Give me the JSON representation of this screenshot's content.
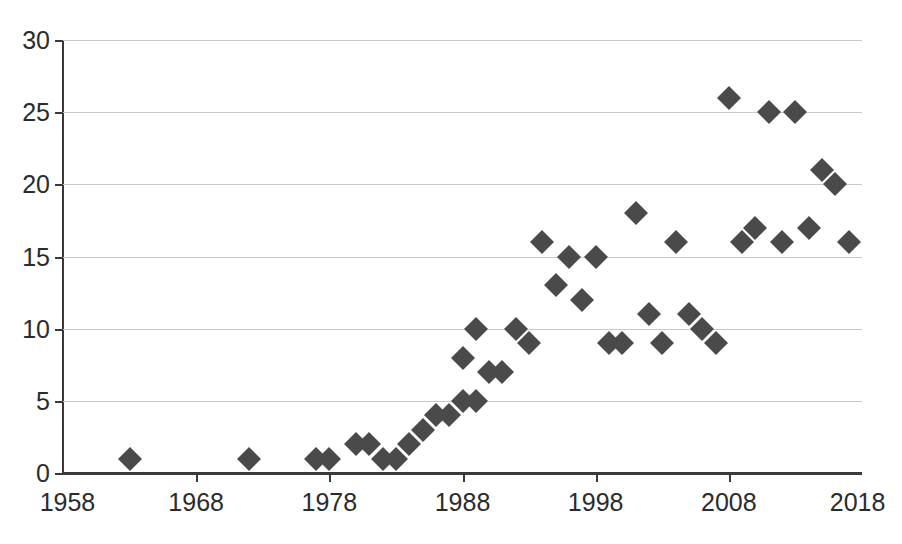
{
  "chart_data": {
    "type": "scatter",
    "title": "",
    "subtitle": "",
    "xlabel": "",
    "ylabel": "",
    "xlim": [
      1958,
      2018
    ],
    "ylim": [
      0,
      30
    ],
    "xticks": [
      1958,
      1968,
      1978,
      1988,
      1998,
      2008,
      2018
    ],
    "yticks": [
      0,
      5,
      10,
      15,
      20,
      25,
      30
    ],
    "xtick_labels": [
      "1958",
      "1968",
      "1978",
      "1988",
      "1998",
      "2008",
      "2018"
    ],
    "ytick_labels": [
      "0",
      "5",
      "10",
      "15",
      "20",
      "25",
      "30"
    ],
    "grid": "horizontal",
    "legend": null,
    "marker": "diamond",
    "marker_color": "#4a4a4a",
    "series": [
      {
        "name": "series-1",
        "points": [
          {
            "x": 1963,
            "y": 1
          },
          {
            "x": 1972,
            "y": 1
          },
          {
            "x": 1977,
            "y": 1
          },
          {
            "x": 1978,
            "y": 1
          },
          {
            "x": 1980,
            "y": 2
          },
          {
            "x": 1981,
            "y": 2
          },
          {
            "x": 1982,
            "y": 1
          },
          {
            "x": 1983,
            "y": 1
          },
          {
            "x": 1984,
            "y": 2
          },
          {
            "x": 1985,
            "y": 3
          },
          {
            "x": 1986,
            "y": 4
          },
          {
            "x": 1987,
            "y": 4
          },
          {
            "x": 1988,
            "y": 5
          },
          {
            "x": 1989,
            "y": 5
          },
          {
            "x": 1988,
            "y": 8
          },
          {
            "x": 1989,
            "y": 10
          },
          {
            "x": 1990,
            "y": 7
          },
          {
            "x": 1991,
            "y": 7
          },
          {
            "x": 1992,
            "y": 10
          },
          {
            "x": 1993,
            "y": 9
          },
          {
            "x": 1994,
            "y": 16
          },
          {
            "x": 1995,
            "y": 13
          },
          {
            "x": 1996,
            "y": 15
          },
          {
            "x": 1997,
            "y": 12
          },
          {
            "x": 1998,
            "y": 15
          },
          {
            "x": 1999,
            "y": 9
          },
          {
            "x": 2000,
            "y": 9
          },
          {
            "x": 2001,
            "y": 18
          },
          {
            "x": 2002,
            "y": 11
          },
          {
            "x": 2003,
            "y": 9
          },
          {
            "x": 2004,
            "y": 16
          },
          {
            "x": 2005,
            "y": 11
          },
          {
            "x": 2006,
            "y": 10
          },
          {
            "x": 2007,
            "y": 9
          },
          {
            "x": 2008,
            "y": 26
          },
          {
            "x": 2009,
            "y": 16
          },
          {
            "x": 2010,
            "y": 17
          },
          {
            "x": 2011,
            "y": 25
          },
          {
            "x": 2012,
            "y": 16
          },
          {
            "x": 2013,
            "y": 25
          },
          {
            "x": 2014,
            "y": 17
          },
          {
            "x": 2015,
            "y": 21
          },
          {
            "x": 2016,
            "y": 20
          },
          {
            "x": 2017,
            "y": 16
          }
        ]
      }
    ]
  }
}
